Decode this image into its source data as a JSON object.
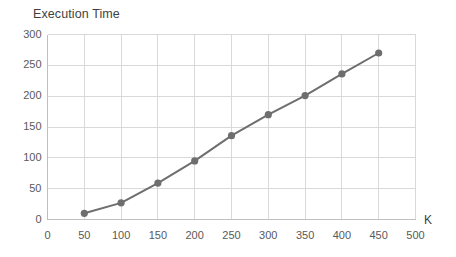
{
  "chart_data": {
    "type": "line",
    "title": "Execution Time",
    "xlabel": "K",
    "ylabel": "",
    "x": [
      50,
      100,
      150,
      200,
      250,
      300,
      350,
      400,
      450
    ],
    "values": [
      10,
      27,
      59,
      95,
      136,
      170,
      201,
      236,
      270
    ],
    "series": [
      {
        "name": "Execution Time",
        "values": [
          10,
          27,
          59,
          95,
          136,
          170,
          201,
          236,
          270
        ]
      }
    ],
    "xlim": [
      0,
      500
    ],
    "ylim": [
      0,
      300
    ],
    "xticks": [
      0,
      50,
      100,
      150,
      200,
      250,
      300,
      350,
      400,
      450,
      500
    ],
    "yticks": [
      0,
      50,
      100,
      150,
      200,
      250,
      300
    ],
    "xtick_labels": [
      "0",
      "50",
      "100",
      "150",
      "200",
      "250",
      "300",
      "350",
      "400",
      "450",
      "500"
    ],
    "ytick_labels": [
      "0",
      "50",
      "100",
      "150",
      "200",
      "250",
      "300"
    ],
    "grid": true,
    "grid_axis": "both",
    "legend": false,
    "legend_position": "none",
    "marker": "circle",
    "colors": {
      "line": "#6e6e6e",
      "marker": "#6e6e6e",
      "grid": "#d9d9d9",
      "axis": "#bfbfbf",
      "text": "#595959",
      "title_text": "#3f3f3f",
      "background": "#ffffff"
    }
  }
}
